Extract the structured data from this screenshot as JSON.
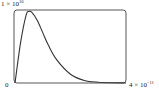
{
  "chart_data": {
    "type": "line",
    "title": "",
    "xlabel": "",
    "ylabel": "",
    "xlim": [
      0,
      4e-11
    ],
    "ylim": [
      0,
      10000000000.0
    ],
    "grid": false,
    "legend": null,
    "tick_labels": {
      "y_top": "1 × 10",
      "y_top_exp": "10",
      "x_origin": "0",
      "x_right": "4 × 10",
      "x_right_exp": "−11"
    },
    "series": [
      {
        "name": "curve",
        "x": [
          0,
          2e-12,
          4e-12,
          5e-12,
          6e-12,
          8e-12,
          1e-11,
          1.2e-11,
          1.5e-11,
          2e-11,
          2.5e-11,
          3e-11,
          3.5e-11,
          4e-11
        ],
        "values": [
          0,
          5500000000.0,
          9300000000.0,
          9800000000.0,
          9700000000.0,
          8600000000.0,
          6900000000.0,
          5200000000.0,
          3200000000.0,
          1200000000.0,
          350000000.0,
          100000000.0,
          30000000.0,
          10000000.0
        ]
      }
    ],
    "colors": {
      "line": "#333333",
      "frame": "#444444"
    }
  }
}
